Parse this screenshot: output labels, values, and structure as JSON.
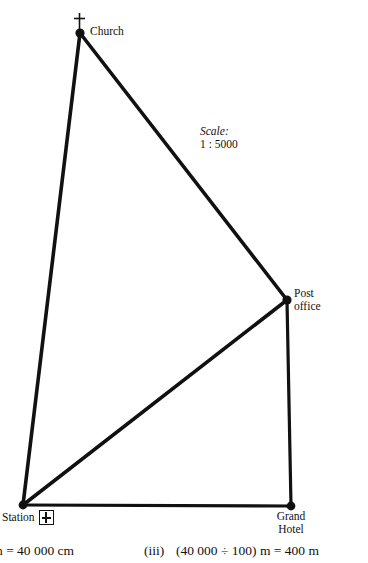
{
  "figure": {
    "background_color": "#ffffff",
    "ink_color": "#111111",
    "scale": {
      "caption": "Scale:",
      "ratio": "1 : 5000"
    },
    "points": [
      {
        "id": "church",
        "label": "Church",
        "x": 80,
        "y": 33,
        "symbol": "cross-icon"
      },
      {
        "id": "post-office",
        "label_line1": "Post",
        "label_line2": "office",
        "x": 287,
        "y": 300,
        "symbol": "none"
      },
      {
        "id": "grand-hotel",
        "label_line1": "Grand",
        "label_line2": "Hotel",
        "x": 291,
        "y": 506,
        "symbol": "none"
      },
      {
        "id": "station",
        "label": "Station",
        "x": 23,
        "y": 505,
        "symbol": "railway-station-icon"
      }
    ],
    "edges": [
      {
        "id": "church-station",
        "from": "church",
        "to": "station"
      },
      {
        "id": "church-post-office",
        "from": "church",
        "to": "post-office"
      },
      {
        "id": "post-office-station",
        "from": "post-office",
        "to": "station"
      },
      {
        "id": "post-office-grand-hotel",
        "from": "post-office",
        "to": "grand-hotel"
      },
      {
        "id": "station-grand-hotel",
        "from": "station",
        "to": "grand-hotel"
      }
    ]
  },
  "bottom_text": {
    "left_expression": "n = 40 000 cm",
    "right_label": "(iii)",
    "right_expression": "(40 000 ÷ 100) m = 400 m"
  }
}
